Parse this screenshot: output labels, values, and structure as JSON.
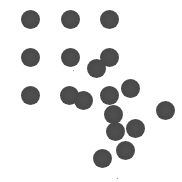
{
  "stimulus": {
    "width": 182,
    "height": 182,
    "background": "#ffffff",
    "dot_color": "#4a4a4a",
    "dot_diameter": 19,
    "dots": [
      {
        "x": 30,
        "y": 19
      },
      {
        "x": 70,
        "y": 19
      },
      {
        "x": 109,
        "y": 19
      },
      {
        "x": 30,
        "y": 57
      },
      {
        "x": 70,
        "y": 57
      },
      {
        "x": 109,
        "y": 57
      },
      {
        "x": 96,
        "y": 68
      },
      {
        "x": 30,
        "y": 95
      },
      {
        "x": 69,
        "y": 95
      },
      {
        "x": 83,
        "y": 100
      },
      {
        "x": 109,
        "y": 95
      },
      {
        "x": 130,
        "y": 88
      },
      {
        "x": 165,
        "y": 110
      },
      {
        "x": 113,
        "y": 114
      },
      {
        "x": 115,
        "y": 131
      },
      {
        "x": 135,
        "y": 128
      },
      {
        "x": 125,
        "y": 150
      },
      {
        "x": 102,
        "y": 158
      }
    ],
    "specks": [
      {
        "x": 73,
        "y": 70
      },
      {
        "x": 117,
        "y": 178
      }
    ]
  }
}
